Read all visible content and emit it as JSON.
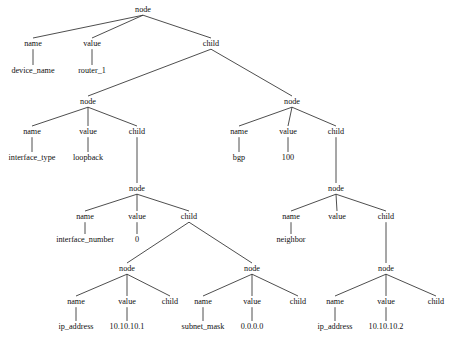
{
  "diagram": {
    "type": "tree",
    "background_color": "#ffffff",
    "line_color": "#3a3a3a",
    "text_color": "#101010",
    "width": 456,
    "height": 346
  },
  "labels": {
    "node": "node",
    "name": "name",
    "value": "value",
    "child": "child"
  },
  "nodes": [
    {
      "id": "n0",
      "text": "node",
      "kind": "node",
      "x": 143,
      "y": 12
    },
    {
      "id": "n0f1",
      "text": "name",
      "kind": "field",
      "x": 33,
      "y": 46
    },
    {
      "id": "n0f2",
      "text": "value",
      "kind": "field",
      "x": 92,
      "y": 46
    },
    {
      "id": "n0f3",
      "text": "child",
      "kind": "field",
      "x": 211,
      "y": 46
    },
    {
      "id": "n0l1",
      "text": "device_name",
      "kind": "leaf",
      "x": 33,
      "y": 73
    },
    {
      "id": "n0l2",
      "text": "router_1",
      "kind": "leaf",
      "x": 92,
      "y": 73
    },
    {
      "id": "n1",
      "text": "node",
      "kind": "node",
      "x": 88,
      "y": 104
    },
    {
      "id": "n1f1",
      "text": "name",
      "kind": "field",
      "x": 32,
      "y": 134
    },
    {
      "id": "n1f2",
      "text": "value",
      "kind": "field",
      "x": 88,
      "y": 134
    },
    {
      "id": "n1f3",
      "text": "child",
      "kind": "field",
      "x": 137,
      "y": 134
    },
    {
      "id": "n1l1",
      "text": "interface_type",
      "kind": "leaf",
      "x": 32,
      "y": 160
    },
    {
      "id": "n1l2",
      "text": "loopback",
      "kind": "leaf",
      "x": 88,
      "y": 160
    },
    {
      "id": "n2",
      "text": "node",
      "kind": "node",
      "x": 292,
      "y": 104
    },
    {
      "id": "n2f1",
      "text": "name",
      "kind": "field",
      "x": 239,
      "y": 134
    },
    {
      "id": "n2f2",
      "text": "value",
      "kind": "field",
      "x": 288,
      "y": 134
    },
    {
      "id": "n2f3",
      "text": "child",
      "kind": "field",
      "x": 336,
      "y": 134
    },
    {
      "id": "n2l1",
      "text": "bgp",
      "kind": "leaf",
      "x": 239,
      "y": 160
    },
    {
      "id": "n2l2",
      "text": "100",
      "kind": "leaf",
      "x": 288,
      "y": 160
    },
    {
      "id": "n3",
      "text": "node",
      "kind": "node",
      "x": 137,
      "y": 191
    },
    {
      "id": "n3f1",
      "text": "name",
      "kind": "field",
      "x": 85,
      "y": 219
    },
    {
      "id": "n3f2",
      "text": "value",
      "kind": "field",
      "x": 137,
      "y": 219
    },
    {
      "id": "n3f3",
      "text": "child",
      "kind": "field",
      "x": 189,
      "y": 219
    },
    {
      "id": "n3l1",
      "text": "interface_number",
      "kind": "leaf",
      "x": 85,
      "y": 242
    },
    {
      "id": "n3l2",
      "text": "0",
      "kind": "leaf",
      "x": 137,
      "y": 242
    },
    {
      "id": "n4",
      "text": "node",
      "kind": "node",
      "x": 336,
      "y": 191
    },
    {
      "id": "n4f1",
      "text": "name",
      "kind": "field",
      "x": 291,
      "y": 219
    },
    {
      "id": "n4f2",
      "text": "value",
      "kind": "field",
      "x": 337,
      "y": 219
    },
    {
      "id": "n4f3",
      "text": "child",
      "kind": "field",
      "x": 386,
      "y": 219
    },
    {
      "id": "n4l1",
      "text": "neighbor",
      "kind": "leaf",
      "x": 291,
      "y": 242
    },
    {
      "id": "n5",
      "text": "node",
      "kind": "node",
      "x": 127,
      "y": 271
    },
    {
      "id": "n5f1",
      "text": "name",
      "kind": "field",
      "x": 76,
      "y": 304
    },
    {
      "id": "n5f2",
      "text": "value",
      "kind": "field",
      "x": 127,
      "y": 304
    },
    {
      "id": "n5f3",
      "text": "child",
      "kind": "field",
      "x": 170,
      "y": 304
    },
    {
      "id": "n5l1",
      "text": "ip_address",
      "kind": "leaf",
      "x": 76,
      "y": 329
    },
    {
      "id": "n5l2",
      "text": "10.10.10.1",
      "kind": "leaf",
      "x": 127,
      "y": 329
    },
    {
      "id": "n6",
      "text": "node",
      "kind": "node",
      "x": 252,
      "y": 271
    },
    {
      "id": "n6f1",
      "text": "name",
      "kind": "field",
      "x": 203,
      "y": 304
    },
    {
      "id": "n6f2",
      "text": "value",
      "kind": "field",
      "x": 252,
      "y": 304
    },
    {
      "id": "n6f3",
      "text": "child",
      "kind": "field",
      "x": 298,
      "y": 304
    },
    {
      "id": "n6l1",
      "text": "subnet_mask",
      "kind": "leaf",
      "x": 203,
      "y": 329
    },
    {
      "id": "n6l2",
      "text": "0.0.0.0",
      "kind": "leaf",
      "x": 252,
      "y": 329
    },
    {
      "id": "n7",
      "text": "node",
      "kind": "node",
      "x": 386,
      "y": 271
    },
    {
      "id": "n7f1",
      "text": "name",
      "kind": "field",
      "x": 335,
      "y": 304
    },
    {
      "id": "n7f2",
      "text": "value",
      "kind": "field",
      "x": 386,
      "y": 304
    },
    {
      "id": "n7f3",
      "text": "child",
      "kind": "field",
      "x": 436,
      "y": 304
    },
    {
      "id": "n7l1",
      "text": "ip_address",
      "kind": "leaf",
      "x": 335,
      "y": 329
    },
    {
      "id": "n7l2",
      "text": "10.10.10.2",
      "kind": "leaf",
      "x": 386,
      "y": 329
    }
  ],
  "edges": [
    {
      "from": "n0",
      "to": "n0f1"
    },
    {
      "from": "n0",
      "to": "n0f2"
    },
    {
      "from": "n0",
      "to": "n0f3"
    },
    {
      "from": "n0f1",
      "to": "n0l1"
    },
    {
      "from": "n0f2",
      "to": "n0l2"
    },
    {
      "from": "n0f3",
      "to": "n1"
    },
    {
      "from": "n0f3",
      "to": "n2"
    },
    {
      "from": "n1",
      "to": "n1f1"
    },
    {
      "from": "n1",
      "to": "n1f2"
    },
    {
      "from": "n1",
      "to": "n1f3"
    },
    {
      "from": "n1f1",
      "to": "n1l1"
    },
    {
      "from": "n1f2",
      "to": "n1l2"
    },
    {
      "from": "n1f3",
      "to": "n3"
    },
    {
      "from": "n2",
      "to": "n2f1"
    },
    {
      "from": "n2",
      "to": "n2f2"
    },
    {
      "from": "n2",
      "to": "n2f3"
    },
    {
      "from": "n2f1",
      "to": "n2l1"
    },
    {
      "from": "n2f2",
      "to": "n2l2"
    },
    {
      "from": "n2f3",
      "to": "n4"
    },
    {
      "from": "n3",
      "to": "n3f1"
    },
    {
      "from": "n3",
      "to": "n3f2"
    },
    {
      "from": "n3",
      "to": "n3f3"
    },
    {
      "from": "n3f1",
      "to": "n3l1"
    },
    {
      "from": "n3f2",
      "to": "n3l2"
    },
    {
      "from": "n3f3",
      "to": "n5"
    },
    {
      "from": "n3f3",
      "to": "n6"
    },
    {
      "from": "n4",
      "to": "n4f1"
    },
    {
      "from": "n4",
      "to": "n4f2"
    },
    {
      "from": "n4",
      "to": "n4f3"
    },
    {
      "from": "n4f1",
      "to": "n4l1"
    },
    {
      "from": "n4f3",
      "to": "n7"
    },
    {
      "from": "n5",
      "to": "n5f1"
    },
    {
      "from": "n5",
      "to": "n5f2"
    },
    {
      "from": "n5",
      "to": "n5f3"
    },
    {
      "from": "n5f1",
      "to": "n5l1"
    },
    {
      "from": "n5f2",
      "to": "n5l2"
    },
    {
      "from": "n6",
      "to": "n6f1"
    },
    {
      "from": "n6",
      "to": "n6f2"
    },
    {
      "from": "n6",
      "to": "n6f3"
    },
    {
      "from": "n6f1",
      "to": "n6l1"
    },
    {
      "from": "n6f2",
      "to": "n6l2"
    },
    {
      "from": "n7",
      "to": "n7f1"
    },
    {
      "from": "n7",
      "to": "n7f2"
    },
    {
      "from": "n7",
      "to": "n7f3"
    },
    {
      "from": "n7f1",
      "to": "n7l1"
    },
    {
      "from": "n7f2",
      "to": "n7l2"
    }
  ]
}
